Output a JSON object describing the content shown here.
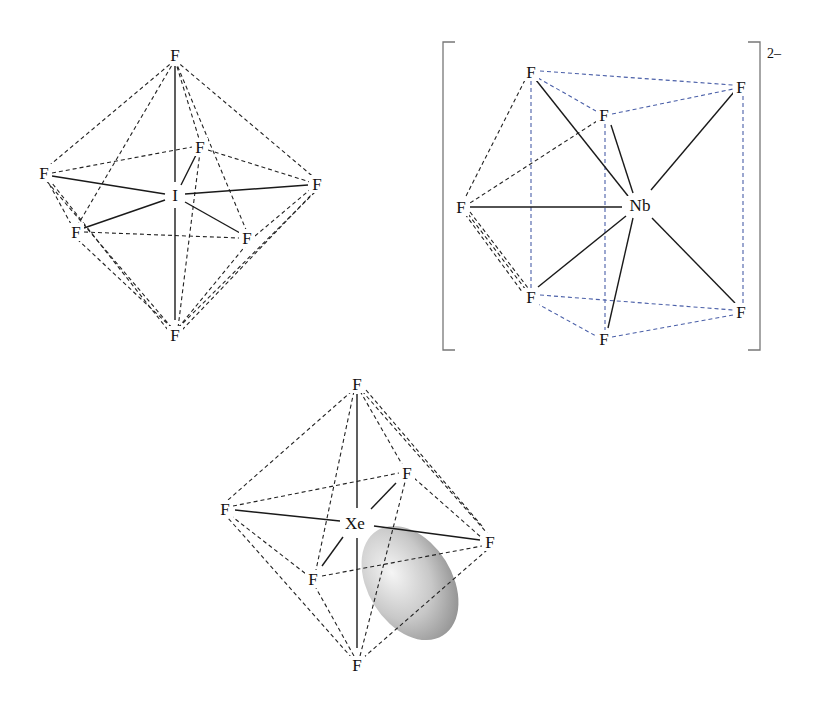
{
  "figure": {
    "colors": {
      "bond": "#1a1a1a",
      "edge_dashed": "#222222",
      "edge_dashed_blue": "#4a5fa8",
      "bracket": "#777777",
      "lone_pair_light": "#f2f2f2",
      "lone_pair_dark": "#8a8a8a"
    }
  },
  "molecules": [
    {
      "id": "IF7",
      "geometry": "pentagonal bipyramid",
      "central_atom": {
        "label": "I",
        "x": 175,
        "y": 195
      },
      "ligands": [
        {
          "label": "F",
          "x": 175,
          "y": 55,
          "pos": "axial-top"
        },
        {
          "label": "F",
          "x": 200,
          "y": 147,
          "pos": "equatorial-back"
        },
        {
          "label": "F",
          "x": 44,
          "y": 173,
          "pos": "equatorial-left"
        },
        {
          "label": "F",
          "x": 317,
          "y": 184,
          "pos": "equatorial-right"
        },
        {
          "label": "F",
          "x": 76,
          "y": 232,
          "pos": "equatorial-front-left"
        },
        {
          "label": "F",
          "x": 247,
          "y": 238,
          "pos": "equatorial-front-right"
        },
        {
          "label": "F",
          "x": 175,
          "y": 335,
          "pos": "axial-bottom"
        }
      ]
    },
    {
      "id": "NbF8",
      "geometry": "square antiprism",
      "charge": "2–",
      "central_atom": {
        "label": "Nb",
        "x": 640,
        "y": 205
      },
      "ligands": [
        {
          "label": "F",
          "x": 531,
          "y": 72
        },
        {
          "label": "F",
          "x": 741,
          "y": 87
        },
        {
          "label": "F",
          "x": 604,
          "y": 115
        },
        {
          "label": "F",
          "x": 461,
          "y": 207
        },
        {
          "label": "F",
          "x": 531,
          "y": 297
        },
        {
          "label": "F",
          "x": 741,
          "y": 312
        },
        {
          "label": "F",
          "x": 604,
          "y": 339
        }
      ]
    },
    {
      "id": "XeF6",
      "geometry": "distorted octahedron with lone pair",
      "central_atom": {
        "label": "Xe",
        "x": 355,
        "y": 523
      },
      "ligands": [
        {
          "label": "F",
          "x": 357,
          "y": 384,
          "pos": "top"
        },
        {
          "label": "F",
          "x": 407,
          "y": 473,
          "pos": "back-right"
        },
        {
          "label": "F",
          "x": 225,
          "y": 509,
          "pos": "left"
        },
        {
          "label": "F",
          "x": 490,
          "y": 542,
          "pos": "right"
        },
        {
          "label": "F",
          "x": 313,
          "y": 579,
          "pos": "front-left"
        },
        {
          "label": "F",
          "x": 357,
          "y": 665,
          "pos": "bottom"
        }
      ],
      "lone_pair": {
        "cx": 410,
        "cy": 583,
        "rx": 44,
        "ry": 62,
        "rotate": -30
      }
    }
  ],
  "labels": {
    "F": "F",
    "I": "I",
    "Nb": "Nb",
    "Xe": "Xe",
    "charge": "2–"
  }
}
